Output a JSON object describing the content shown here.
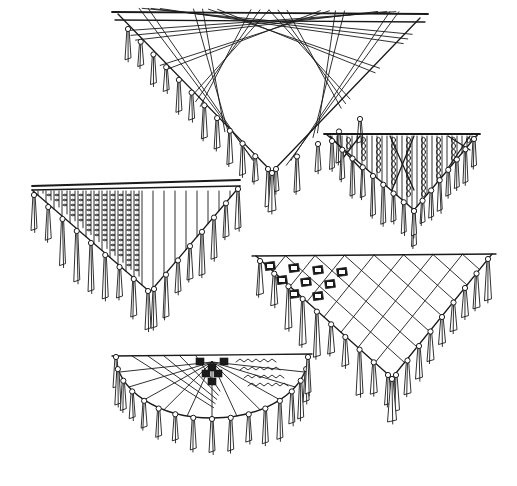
{
  "illustration": {
    "subject": "pen sketches of fringed triangular shawls",
    "style": "black ink line drawing on white",
    "ink_color": "#1a1a1a",
    "background_color": "#ffffff",
    "shawls": [
      {
        "id": "shawl-plaid-large",
        "pattern": "diagonal plaid grid",
        "shape": "triangle"
      },
      {
        "id": "shawl-embroidered-right",
        "pattern": "dense embroidered vertical bands with diagonal struts",
        "shape": "triangle"
      },
      {
        "id": "shawl-striped-left",
        "pattern": "vertical embroidered stripes",
        "shape": "triangle"
      },
      {
        "id": "shawl-lattice-right",
        "pattern": "diamond lattice with embroidered motif squares",
        "shape": "triangle"
      },
      {
        "id": "shawl-halfmoon-bottom",
        "pattern": "radiating ribs with motif squares and zigzag bands",
        "shape": "semicircle"
      }
    ]
  }
}
